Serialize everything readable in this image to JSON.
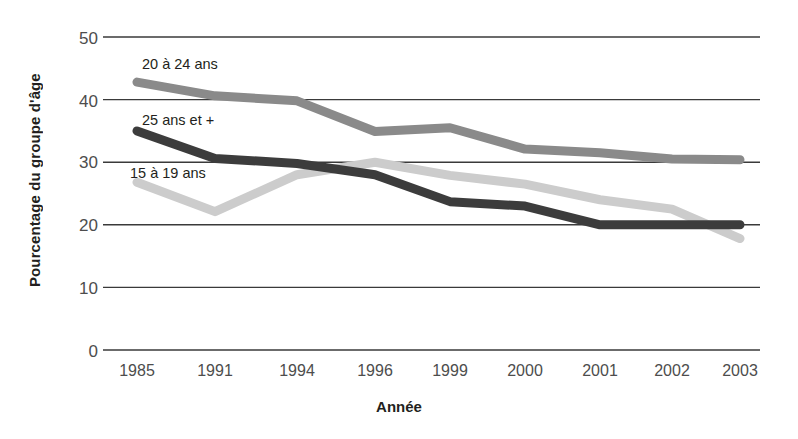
{
  "chart_data": {
    "type": "line",
    "title": "",
    "xlabel": "Année",
    "ylabel": "Pourcentage du groupe d'âge",
    "categories": [
      "1985",
      "1991",
      "1994",
      "1996",
      "1999",
      "2000",
      "2001",
      "2002",
      "2003"
    ],
    "ylim": [
      0,
      50
    ],
    "yticks": [
      0,
      10,
      20,
      30,
      40,
      50
    ],
    "grid": true,
    "legend_position": "inline-labels",
    "series": [
      {
        "name": "20 à 24 ans",
        "color": "#8a8a8a",
        "values": [
          42.8,
          40.6,
          39.8,
          34.9,
          35.5,
          32.1,
          31.5,
          30.5,
          30.4
        ]
      },
      {
        "name": "25 ans et +",
        "color": "#3c3c3c",
        "values": [
          35.0,
          30.6,
          29.8,
          28.0,
          23.7,
          23.0,
          20.0,
          20.0,
          20.0
        ]
      },
      {
        "name": "15 à 19 ans",
        "color": "#cccccc",
        "values": [
          26.8,
          22.1,
          28.0,
          30.0,
          27.9,
          26.5,
          24.0,
          22.5,
          17.8
        ]
      }
    ]
  },
  "axes": {
    "y_title": "Pourcentage du groupe d'âge",
    "x_title": "Année",
    "y_tick_labels": [
      "50",
      "40",
      "30",
      "20",
      "10",
      "0"
    ],
    "x_tick_labels": [
      "1985",
      "1991",
      "1994",
      "1996",
      "1999",
      "2000",
      "2001",
      "2002",
      "2003"
    ]
  },
  "series_labels": [
    {
      "text": "20 à 24 ans",
      "left": 142,
      "top": 57
    },
    {
      "text": "25 ans et +",
      "left": 142,
      "top": 113
    },
    {
      "text": "15 à 19 ans",
      "left": 130,
      "top": 166
    }
  ],
  "colors": {
    "series_20_24": "#8a8a8a",
    "series_25_plus": "#3c3c3c",
    "series_15_19": "#cccccc",
    "gridline": "#3a3a3a",
    "tick_text": "#4d4d4d",
    "title_text": "#231f20",
    "background": "#ffffff"
  }
}
